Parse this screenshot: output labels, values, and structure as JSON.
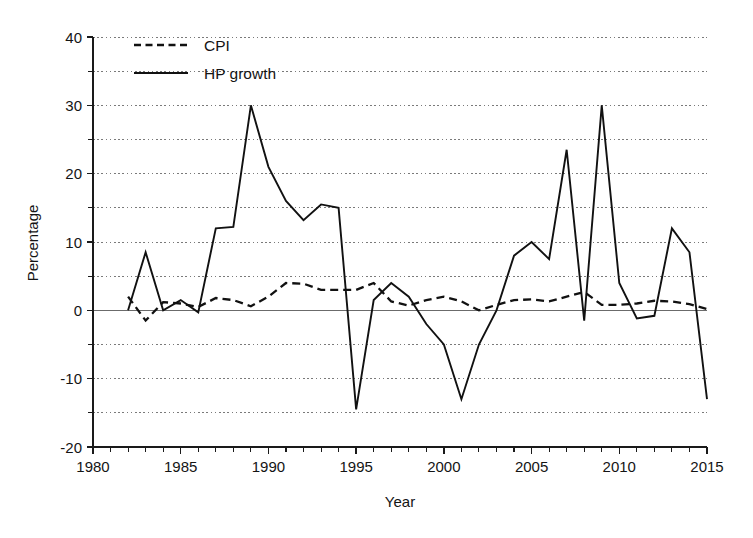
{
  "chart_data": {
    "type": "line",
    "title": "",
    "subtitle": "",
    "xlabel": "Year",
    "ylabel": "Percentage",
    "xlim": [
      1980,
      2015
    ],
    "ylim": [
      -20,
      40
    ],
    "xticks": [
      1980,
      1985,
      1990,
      1995,
      2000,
      2005,
      2010,
      2015
    ],
    "yticks": [
      -20,
      -10,
      0,
      10,
      20,
      30,
      40
    ],
    "y_minor_ticks": [
      -15,
      -5,
      5,
      15,
      25,
      35
    ],
    "x_minor_tick_interval": 1,
    "grid": "horizontal dotted gridlines every 5 units",
    "legend_position": "top-left inside plot area",
    "x": [
      1982,
      1983,
      1984,
      1985,
      1986,
      1987,
      1988,
      1989,
      1990,
      1991,
      1992,
      1993,
      1994,
      1995,
      1996,
      1997,
      1998,
      1999,
      2000,
      2001,
      2002,
      2003,
      2004,
      2005,
      2006,
      2007,
      2008,
      2009,
      2010,
      2011,
      2012,
      2013,
      2014,
      2015
    ],
    "series": [
      {
        "name": "CPI",
        "style": "dashed",
        "color": "#111111",
        "values": [
          2.0,
          -1.5,
          1.2,
          1.0,
          0.5,
          1.8,
          1.5,
          0.6,
          2.0,
          4.0,
          3.9,
          3.0,
          3.0,
          3.0,
          4.0,
          1.3,
          0.7,
          1.5,
          2.0,
          1.3,
          0.0,
          0.8,
          1.5,
          1.6,
          1.3,
          2.0,
          2.7,
          0.8,
          0.8,
          1.0,
          1.4,
          1.3,
          0.9,
          0.2
        ]
      },
      {
        "name": "HP growth",
        "style": "solid",
        "color": "#111111",
        "values": [
          0.0,
          8.5,
          0.0,
          1.5,
          -0.3,
          12.0,
          12.2,
          30.0,
          21.0,
          16.0,
          13.2,
          15.5,
          15.0,
          -14.5,
          1.5,
          4.0,
          2.0,
          -2.0,
          -5.0,
          -13.0,
          -5.0,
          0.0,
          8.0,
          10.0,
          7.5,
          23.5,
          -1.5,
          30.0,
          4.0,
          -1.2,
          -0.8,
          12.0,
          8.5,
          -13.0
        ]
      }
    ],
    "annotations": []
  },
  "legend": {
    "items": [
      {
        "label": "CPI",
        "style": "dashed"
      },
      {
        "label": "HP growth",
        "style": "solid"
      }
    ]
  },
  "axes": {
    "x_title": "Year",
    "y_title": "Percentage",
    "x_tick_labels": [
      "1980",
      "1985",
      "1990",
      "1995",
      "2000",
      "2005",
      "2010",
      "2015"
    ],
    "y_tick_labels": [
      "40",
      "30",
      "20",
      "10",
      "0",
      "-10",
      "-20"
    ]
  },
  "colors": {
    "line": "#111111",
    "grid": "#7a7a7a",
    "axis": "#1a1a1a",
    "background": "#ffffff"
  }
}
